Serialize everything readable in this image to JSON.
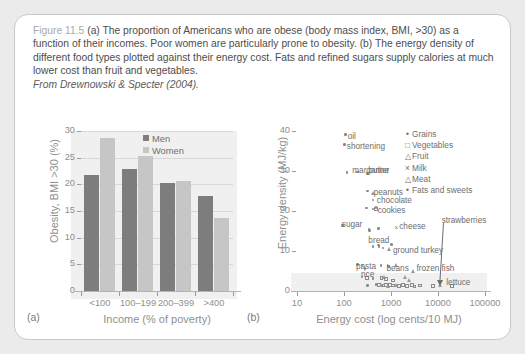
{
  "caption": {
    "figure_no": "Figure 11.5",
    "text_a": "(a) The proportion of Americans who are obese (body mass index, BMI, >30) as a function of their incomes. Poor women are particularly prone to obesity.",
    "text_b": "(b) The energy density of different food types plotted against their energy cost. Fats and refined sugars supply calories at much lower cost than fruit and vegetables.",
    "source": "From Drewnowski & Specter (2004)."
  },
  "panel_labels": {
    "a": "(a)",
    "b": "(b)"
  },
  "colors": {
    "men_bar": "#7d7d7d",
    "women_bar": "#c6c6c6",
    "axis": "#8f8f8f",
    "plot_shade": "#f0f0f0",
    "card_border": "#c9c9c9",
    "page_bg": "#ebebeb"
  },
  "chart_data": [
    {
      "type": "bar",
      "title": "",
      "xlabel": "Income (% of poverty)",
      "ylabel": "Obesity, BMI >30 (%)",
      "categories": [
        "<100",
        "100–199",
        "200–399",
        ">400"
      ],
      "series": [
        {
          "name": "Men",
          "values": [
            21.7,
            22.8,
            20.3,
            17.8
          ]
        },
        {
          "name": "Women",
          "values": [
            28.6,
            25.3,
            20.7,
            13.7
          ]
        }
      ],
      "ylim": [
        0,
        30
      ],
      "yticks": [
        0,
        5,
        10,
        15,
        20,
        25,
        30
      ],
      "grid": true,
      "legend_position": "top-right"
    },
    {
      "type": "scatter",
      "title": "",
      "xlabel": "Energy cost (log cents/10 MJ)",
      "ylabel": "Energy density (MJ/kg)",
      "xscale": "log",
      "xlim": [
        10,
        100000
      ],
      "xticks": [
        10,
        100,
        1000,
        10000,
        100000
      ],
      "xticklabels": [
        "10",
        "100",
        "1000",
        "10000",
        "100000"
      ],
      "ylim": [
        0,
        40
      ],
      "yticks": [
        0,
        10,
        20,
        30,
        40
      ],
      "grid": false,
      "legend_position": "top-right",
      "legend": [
        {
          "label": "Grains",
          "marker": "dot"
        },
        {
          "label": "Vegetables",
          "marker": "open-square"
        },
        {
          "label": "Fruit",
          "marker": "open-triangle"
        },
        {
          "label": "Milk",
          "marker": "cross"
        },
        {
          "label": "Meat",
          "marker": "open-triangle"
        },
        {
          "label": "Fats and sweets",
          "marker": "dot"
        }
      ],
      "annotations": [
        {
          "text": "oil",
          "x": 120,
          "y": 38.5
        },
        {
          "text": "shortening",
          "x": 115,
          "y": 36.0
        },
        {
          "text": "margarine",
          "x": 150,
          "y": 30.0
        },
        {
          "text": "butter",
          "x": 330,
          "y": 30.0
        },
        {
          "text": "peanuts",
          "x": 430,
          "y": 24.5
        },
        {
          "text": "chocolate",
          "x": 500,
          "y": 22.5
        },
        {
          "text": "cookies",
          "x": 520,
          "y": 20.0
        },
        {
          "text": "sugar",
          "x": 90,
          "y": 16.5
        },
        {
          "text": "cheese",
          "x": 1500,
          "y": 16.0
        },
        {
          "text": "bread",
          "x": 330,
          "y": 12.5
        },
        {
          "text": "ground turkey",
          "x": 1100,
          "y": 10.0
        },
        {
          "text": "pasta",
          "x": 180,
          "y": 6.0
        },
        {
          "text": "beans",
          "x": 800,
          "y": 5.5
        },
        {
          "text": "frozen fish",
          "x": 3500,
          "y": 5.5
        },
        {
          "text": "rice",
          "x": 230,
          "y": 4.0
        },
        {
          "text": "lettuce",
          "x": 15000,
          "y": 2.0
        },
        {
          "text": "strawberries",
          "x": 12000,
          "y": 17.5,
          "arrow_to_x": 11000,
          "arrow_to_y": 1.6
        }
      ],
      "points": [
        {
          "x": 110,
          "y": 39.0,
          "marker": "dot"
        },
        {
          "x": 105,
          "y": 36.5,
          "marker": "dot"
        },
        {
          "x": 120,
          "y": 29.5,
          "marker": "dot"
        },
        {
          "x": 200,
          "y": 29.6,
          "marker": "dot"
        },
        {
          "x": 330,
          "y": 29.2,
          "marker": "dot"
        },
        {
          "x": 330,
          "y": 24.8,
          "marker": "dot"
        },
        {
          "x": 420,
          "y": 24.5,
          "marker": "open-triangle"
        },
        {
          "x": 430,
          "y": 22.6,
          "marker": "dot"
        },
        {
          "x": 310,
          "y": 20.6,
          "marker": "dot"
        },
        {
          "x": 430,
          "y": 20.3,
          "marker": "dot"
        },
        {
          "x": 480,
          "y": 20.4,
          "marker": "open-square"
        },
        {
          "x": 500,
          "y": 20.7,
          "marker": "dot"
        },
        {
          "x": 95,
          "y": 16.2,
          "marker": "dot"
        },
        {
          "x": 1300,
          "y": 16.1,
          "marker": "cross"
        },
        {
          "x": 350,
          "y": 15.3,
          "marker": "dot"
        },
        {
          "x": 360,
          "y": 14.9,
          "marker": "dot"
        },
        {
          "x": 560,
          "y": 15.5,
          "marker": "dot"
        },
        {
          "x": 430,
          "y": 11.0,
          "marker": "dot"
        },
        {
          "x": 560,
          "y": 11.3,
          "marker": "dot"
        },
        {
          "x": 580,
          "y": 10.9,
          "marker": "dot"
        },
        {
          "x": 700,
          "y": 10.6,
          "marker": "dot"
        },
        {
          "x": 900,
          "y": 10.5,
          "marker": "open-triangle"
        },
        {
          "x": 1050,
          "y": 11.4,
          "marker": "dot"
        },
        {
          "x": 200,
          "y": 6.4,
          "marker": "dot"
        },
        {
          "x": 250,
          "y": 6.3,
          "marker": "dot"
        },
        {
          "x": 290,
          "y": 5.5,
          "marker": "dot"
        },
        {
          "x": 640,
          "y": 6.2,
          "marker": "dot"
        },
        {
          "x": 900,
          "y": 6.1,
          "marker": "open-square"
        },
        {
          "x": 1300,
          "y": 6.4,
          "marker": "open-triangle"
        },
        {
          "x": 3000,
          "y": 5.0,
          "marker": "open-triangle"
        },
        {
          "x": 250,
          "y": 3.3,
          "marker": "dot"
        },
        {
          "x": 310,
          "y": 3.2,
          "marker": "open-square"
        },
        {
          "x": 430,
          "y": 3.0,
          "marker": "dot"
        },
        {
          "x": 640,
          "y": 3.2,
          "marker": "open-square"
        },
        {
          "x": 700,
          "y": 3.4,
          "marker": "open-triangle"
        },
        {
          "x": 800,
          "y": 3.0,
          "marker": "open-square"
        },
        {
          "x": 1100,
          "y": 2.6,
          "marker": "open-square"
        },
        {
          "x": 2000,
          "y": 3.4,
          "marker": "open-triangle"
        },
        {
          "x": 2400,
          "y": 2.8,
          "marker": "open-triangle"
        },
        {
          "x": 330,
          "y": 1.2,
          "marker": "dot"
        },
        {
          "x": 500,
          "y": 1.5,
          "marker": "dot"
        },
        {
          "x": 560,
          "y": 1.4,
          "marker": "open-square"
        },
        {
          "x": 620,
          "y": 1.6,
          "marker": "open-triangle"
        },
        {
          "x": 700,
          "y": 1.3,
          "marker": "open-square"
        },
        {
          "x": 780,
          "y": 1.5,
          "marker": "open-square"
        },
        {
          "x": 860,
          "y": 1.2,
          "marker": "open-triangle"
        },
        {
          "x": 950,
          "y": 1.4,
          "marker": "open-square"
        },
        {
          "x": 1100,
          "y": 1.3,
          "marker": "open-square"
        },
        {
          "x": 1300,
          "y": 1.5,
          "marker": "open-triangle"
        },
        {
          "x": 1500,
          "y": 1.2,
          "marker": "open-square"
        },
        {
          "x": 1800,
          "y": 1.4,
          "marker": "open-square"
        },
        {
          "x": 2200,
          "y": 1.2,
          "marker": "open-square"
        },
        {
          "x": 2800,
          "y": 1.4,
          "marker": "open-square"
        },
        {
          "x": 3200,
          "y": 1.1,
          "marker": "open-square"
        },
        {
          "x": 4200,
          "y": 1.3,
          "marker": "open-square"
        },
        {
          "x": 8000,
          "y": 1.2,
          "marker": "open-square"
        },
        {
          "x": 11000,
          "y": 1.4,
          "marker": "open-triangle"
        },
        {
          "x": 20000,
          "y": 1.2,
          "marker": "open-square"
        }
      ]
    }
  ]
}
